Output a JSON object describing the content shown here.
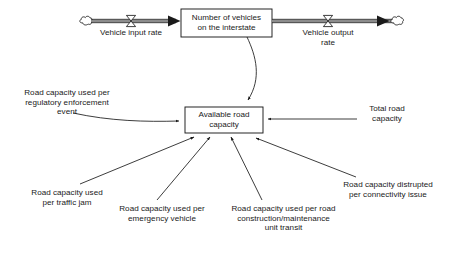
{
  "diagram": {
    "type": "system-dynamics-stock-flow",
    "title_text": "",
    "colors": {
      "stroke": "#1a1a1a",
      "pipe_fill": "#8c8c8c",
      "background": "#ffffff",
      "text": "#1a1a1a"
    },
    "stocks": [
      {
        "id": "vehicles-stock",
        "label": "Number of vehicles\non the interstate",
        "x": 181,
        "y": 9,
        "width": 91,
        "height": 28
      },
      {
        "id": "available-capacity-stock",
        "label": "Available road\ncapacity",
        "x": 185,
        "y": 107,
        "width": 78,
        "height": 26
      }
    ],
    "flows": [
      {
        "id": "vehicle-input-flow",
        "label": "Vehicle input rate",
        "valve_x": 131,
        "valve_y": 21,
        "source": "cloud-source-left",
        "target": "vehicles-stock"
      },
      {
        "id": "vehicle-output-flow",
        "label": "Vehicle output\nrate",
        "valve_x": 328,
        "valve_y": 21,
        "source": "vehicles-stock",
        "target": "cloud-sink-right"
      }
    ],
    "clouds": [
      {
        "id": "cloud-source-left",
        "x": 87,
        "y": 21
      },
      {
        "id": "cloud-sink-right",
        "x": 398,
        "y": 21
      }
    ],
    "variables": [
      {
        "id": "regulatory-enforcement-var",
        "label": "Road capacity used per\nregulatory enforcement\nevent",
        "text_x": 6,
        "text_y": 88,
        "text_width": 122,
        "arrow_from": [
          128,
          120
        ],
        "arrow_to": [
          183,
          120
        ]
      },
      {
        "id": "total-road-capacity-var",
        "label": "Total road\ncapacity",
        "text_x": 358,
        "text_y": 104,
        "text_width": 58,
        "arrow_from": [
          356,
          119
        ],
        "arrow_to": [
          266,
          119
        ]
      },
      {
        "id": "traffic-jam-var",
        "label": "Road capacity used\nper traffic jam",
        "text_x": 15,
        "text_y": 188,
        "text_width": 104,
        "arrow_from": [
          82,
          184
        ],
        "arrow_to": [
          196,
          135
        ]
      },
      {
        "id": "emergency-vehicle-var",
        "label": "Road capacity used per\nemergency vehicle",
        "text_x": 101,
        "text_y": 204,
        "text_width": 122,
        "arrow_from": [
          158,
          200
        ],
        "arrow_to": [
          212,
          135
        ]
      },
      {
        "id": "road-construction-var",
        "label": "Road capacity used per road\nconstruction/maintenance\nunit transit",
        "text_x": 215,
        "text_y": 204,
        "text_width": 137,
        "arrow_from": [
          261,
          200
        ],
        "arrow_to": [
          230,
          135
        ]
      },
      {
        "id": "connectivity-issue-var",
        "label": "Road capacity distrupted\nper connectivity issue",
        "text_x": 327,
        "text_y": 180,
        "text_width": 122,
        "arrow_from": [
          355,
          177
        ],
        "arrow_to": [
          255,
          136
        ]
      }
    ],
    "links": [
      {
        "id": "vehicles-to-capacity-link",
        "from": "vehicles-stock",
        "to": "available-capacity-stock",
        "shape": "curve"
      }
    ]
  }
}
